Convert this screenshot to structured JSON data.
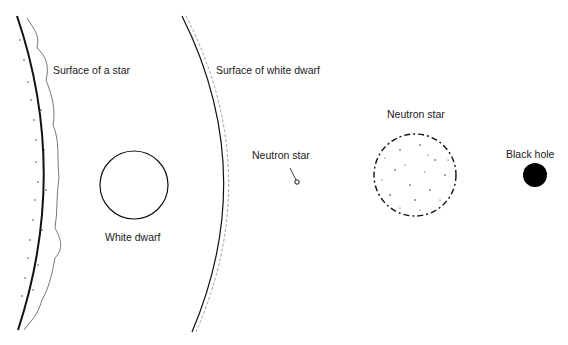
{
  "labels": {
    "star_surface": "Surface of a star",
    "white_dwarf": "White dwarf",
    "white_dwarf_surface": "Surface of white dwarf",
    "neutron_star_small": "Neutron star",
    "neutron_star_large": "Neutron star",
    "black_hole": "Black hole"
  },
  "colors": {
    "ink": "#1a1a1a",
    "background": "#ffffff"
  }
}
